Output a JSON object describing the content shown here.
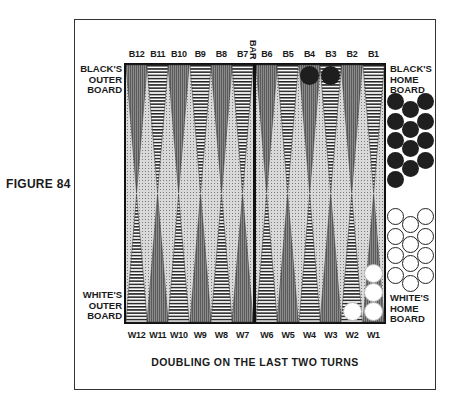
{
  "figure": {
    "label": "FIGURE 84",
    "caption": "DOUBLING ON THE LAST TWO TURNS"
  },
  "board": {
    "bar_label": "BAR",
    "quadrant_labels": {
      "black_outer": [
        "BLACK'S",
        "OUTER",
        "BOARD"
      ],
      "black_home": [
        "BLACK'S",
        "HOME",
        "BOARD"
      ],
      "white_outer": [
        "WHITE'S",
        "OUTER",
        "BOARD"
      ],
      "white_home": [
        "WHITE'S",
        "HOME",
        "BOARD"
      ]
    },
    "top_points": [
      {
        "label": "B12",
        "pattern": "dark"
      },
      {
        "label": "B11",
        "pattern": "striped"
      },
      {
        "label": "B10",
        "pattern": "dark"
      },
      {
        "label": "B9",
        "pattern": "striped"
      },
      {
        "label": "B8",
        "pattern": "dark"
      },
      {
        "label": "B7",
        "pattern": "striped"
      },
      {
        "label": "B6",
        "pattern": "dark"
      },
      {
        "label": "B5",
        "pattern": "striped"
      },
      {
        "label": "B4",
        "pattern": "dark"
      },
      {
        "label": "B3",
        "pattern": "striped"
      },
      {
        "label": "B2",
        "pattern": "dark"
      },
      {
        "label": "B1",
        "pattern": "striped"
      }
    ],
    "bottom_points": [
      {
        "label": "W12",
        "pattern": "striped"
      },
      {
        "label": "W11",
        "pattern": "dark"
      },
      {
        "label": "W10",
        "pattern": "striped"
      },
      {
        "label": "W9",
        "pattern": "dark"
      },
      {
        "label": "W8",
        "pattern": "striped"
      },
      {
        "label": "W7",
        "pattern": "dark"
      },
      {
        "label": "W6",
        "pattern": "striped"
      },
      {
        "label": "W5",
        "pattern": "dark"
      },
      {
        "label": "W4",
        "pattern": "striped"
      },
      {
        "label": "W3",
        "pattern": "dark"
      },
      {
        "label": "W2",
        "pattern": "striped"
      },
      {
        "label": "W1",
        "pattern": "dark"
      }
    ],
    "checkers": {
      "black": [
        {
          "point": "B4",
          "count": 1
        },
        {
          "point": "B3",
          "count": 1
        }
      ],
      "white": [
        {
          "point": "W2",
          "count": 1
        },
        {
          "point": "W1",
          "count": 3
        }
      ]
    },
    "borne_off": {
      "black": 13,
      "white": 12
    },
    "colors": {
      "black_checker": "#1e1e1e",
      "white_checker": "#ffffff",
      "board_bg": "#d9d9d9",
      "dark_point": "#8a8a8a",
      "stripe": "#222222"
    }
  }
}
